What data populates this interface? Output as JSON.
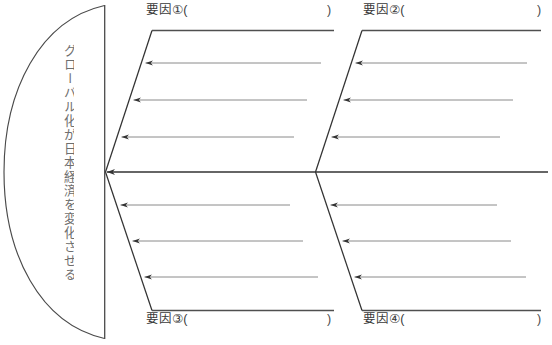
{
  "diagram": {
    "type": "fishbone",
    "effect": {
      "text": "グローバル化が日本経済を変化させる",
      "orientation": "vertical"
    },
    "open_paren": "(",
    "close_paren": ")",
    "causes": [
      {
        "id": "1",
        "label": "要因①(",
        "close": ")",
        "position": "top-left",
        "sub_causes": [
          "",
          "",
          ""
        ]
      },
      {
        "id": "2",
        "label": "要因②(",
        "close": ")",
        "position": "top-right",
        "sub_causes": [
          "",
          "",
          ""
        ]
      },
      {
        "id": "3",
        "label": "要因③(",
        "close": ")",
        "position": "bottom-left",
        "sub_causes": [
          "",
          "",
          ""
        ]
      },
      {
        "id": "4",
        "label": "要因④(",
        "close": ")",
        "position": "bottom-right",
        "sub_causes": [
          "",
          "",
          ""
        ]
      }
    ],
    "colors": {
      "outline": "#4a4a4a",
      "bone": "#333333",
      "sub_arrow": "#8a8a8a",
      "text": "#3a3a3a",
      "effect_text": "#6e6e6e",
      "background": "#ffffff"
    }
  }
}
